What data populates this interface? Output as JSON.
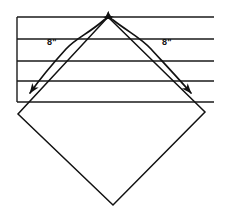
{
  "figure": {
    "background_color": "#ffffff",
    "stroke_color": "#111111",
    "ruled_line_color": "#1a1a1a",
    "measurements": [
      {
        "id": "left-measure",
        "label": "8\"",
        "value": 8,
        "unit": "inch",
        "label_x": 52,
        "label_y": 45,
        "measures": "left upper edge of square"
      },
      {
        "id": "right-measure",
        "label": "8\"",
        "value": 8,
        "unit": "inch",
        "label_x": 167,
        "label_y": 45,
        "measures": "right upper edge of square"
      }
    ],
    "ruled_lines": [
      {
        "id": "rule-1",
        "y": 17,
        "x1": 17,
        "x2": 214
      },
      {
        "id": "rule-2",
        "y": 39,
        "x1": 17,
        "x2": 214
      },
      {
        "id": "rule-3",
        "y": 61,
        "x1": 17,
        "x2": 214
      },
      {
        "id": "rule-4",
        "y": 81,
        "x1": 17,
        "x2": 214
      },
      {
        "id": "rule-5",
        "y": 102,
        "x1": 17,
        "x2": 214
      }
    ],
    "sheet_left_edge": {
      "x": 17,
      "y1": 17,
      "y2": 102
    },
    "square": {
      "id": "rotated-square",
      "top_vertex": {
        "x": 108,
        "y": 17
      },
      "left_vertex": {
        "x": 18,
        "y": 114
      },
      "bottom_vertex": {
        "x": 113,
        "y": 205
      },
      "right_vertex": {
        "x": 205,
        "y": 112
      },
      "side_length_label": "8\""
    },
    "arrows": {
      "left_arrow": {
        "id": "left-double-arrow",
        "from": {
          "x": 104,
          "y": 19
        },
        "to": {
          "x": 28,
          "y": 96
        },
        "double_headed": true
      },
      "right_arrow": {
        "id": "right-double-arrow",
        "from": {
          "x": 113,
          "y": 19
        },
        "to": {
          "x": 196,
          "y": 96
        },
        "double_headed": true
      }
    }
  }
}
